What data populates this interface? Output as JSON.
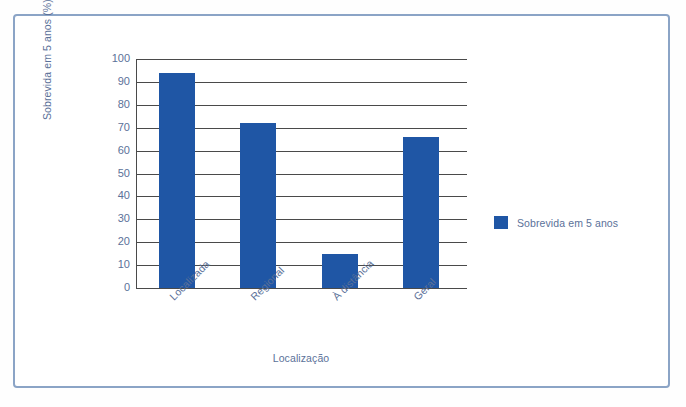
{
  "chart_data": {
    "type": "bar",
    "title": "",
    "subtitle": "",
    "categories": [
      "Localizada",
      "Regional",
      "À distância",
      "Geral"
    ],
    "values": [
      94,
      72,
      15,
      66
    ],
    "series": [
      {
        "name": "Sobrevida em 5 anos",
        "values": [
          94,
          72,
          15,
          66
        ],
        "color": "#1f56a5"
      }
    ],
    "xlabel": "Localização",
    "ylabel": "Sobrevida em 5 anos (%)",
    "ylim": [
      0,
      100
    ],
    "ytick_labels": [
      "100",
      "90",
      "80",
      "70",
      "60",
      "50",
      "40",
      "30",
      "20",
      "10",
      "0"
    ],
    "ytick_values": [
      100,
      90,
      80,
      70,
      60,
      50,
      40,
      30,
      20,
      10,
      0
    ],
    "grid": true,
    "grid_axis": "y",
    "legend": {
      "position": "right",
      "entries": [
        {
          "label": "Sobrevida em 5 anos",
          "color": "#1f56a5"
        }
      ]
    },
    "xtick_rotation": -45,
    "colors": {
      "bar": "#1f56a5",
      "axis": "#4a4a4a",
      "text": "#5b7199",
      "frame": "#8ba4c6",
      "background": "#ffffff"
    }
  }
}
